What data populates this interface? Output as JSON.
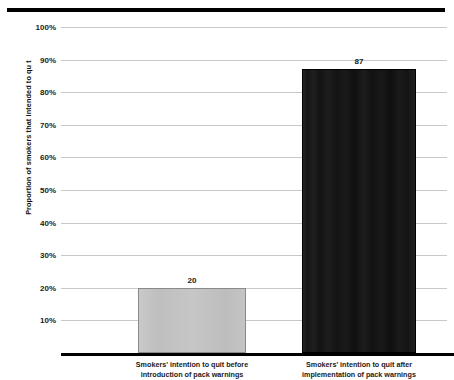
{
  "chart_data": {
    "type": "bar",
    "title": "",
    "xlabel": "",
    "ylabel": "Proportion of smokers that intended to qu t",
    "ylim": [
      0,
      100
    ],
    "grid": true,
    "legend": null,
    "categories": [
      "Smokers' intention to quit before introduction of pack warnings",
      "Smokers' intention to quit after implementation of pack warnings"
    ],
    "category_lines": [
      [
        "Smokers' intention to quit before",
        "introduction of pack warnings"
      ],
      [
        "Smokers' intention to quit after",
        "implementation of pack warnings"
      ]
    ],
    "values": [
      20,
      87
    ],
    "value_labels": [
      "20",
      "87"
    ],
    "bar_colors": [
      "#c4c4c4",
      "#161616"
    ],
    "yticks": [
      10,
      20,
      30,
      40,
      50,
      60,
      70,
      80,
      90,
      100
    ],
    "ytick_labels": [
      "10%",
      "20%",
      "30%",
      "40%",
      "50%",
      "60%",
      "70%",
      "80%",
      "90%",
      "100%"
    ]
  },
  "figure": {
    "background": "#ffffff",
    "grid_color": "#c8c8c8",
    "axis_color": "#000000",
    "top_rule_color": "#000000"
  }
}
